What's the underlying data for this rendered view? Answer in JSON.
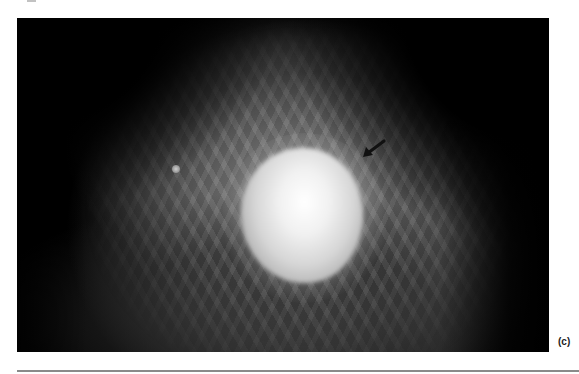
{
  "figure": {
    "panel_label": "(c)",
    "image_description": "Grayscale mammogram showing a large, bright, rounded central mass within fibroglandular tissue, a small round nodule to the left, and a black arrow pointing toward the upper-right margin of the mass.",
    "annotations": [
      {
        "type": "arrow-icon",
        "direction": "down-left",
        "color": "#111111"
      }
    ],
    "colors": {
      "background": "#000000",
      "mass": "#f4f4f4",
      "tissue": "#8c8c8c",
      "page": "#ffffff",
      "rule": "#8a8a8a"
    }
  }
}
